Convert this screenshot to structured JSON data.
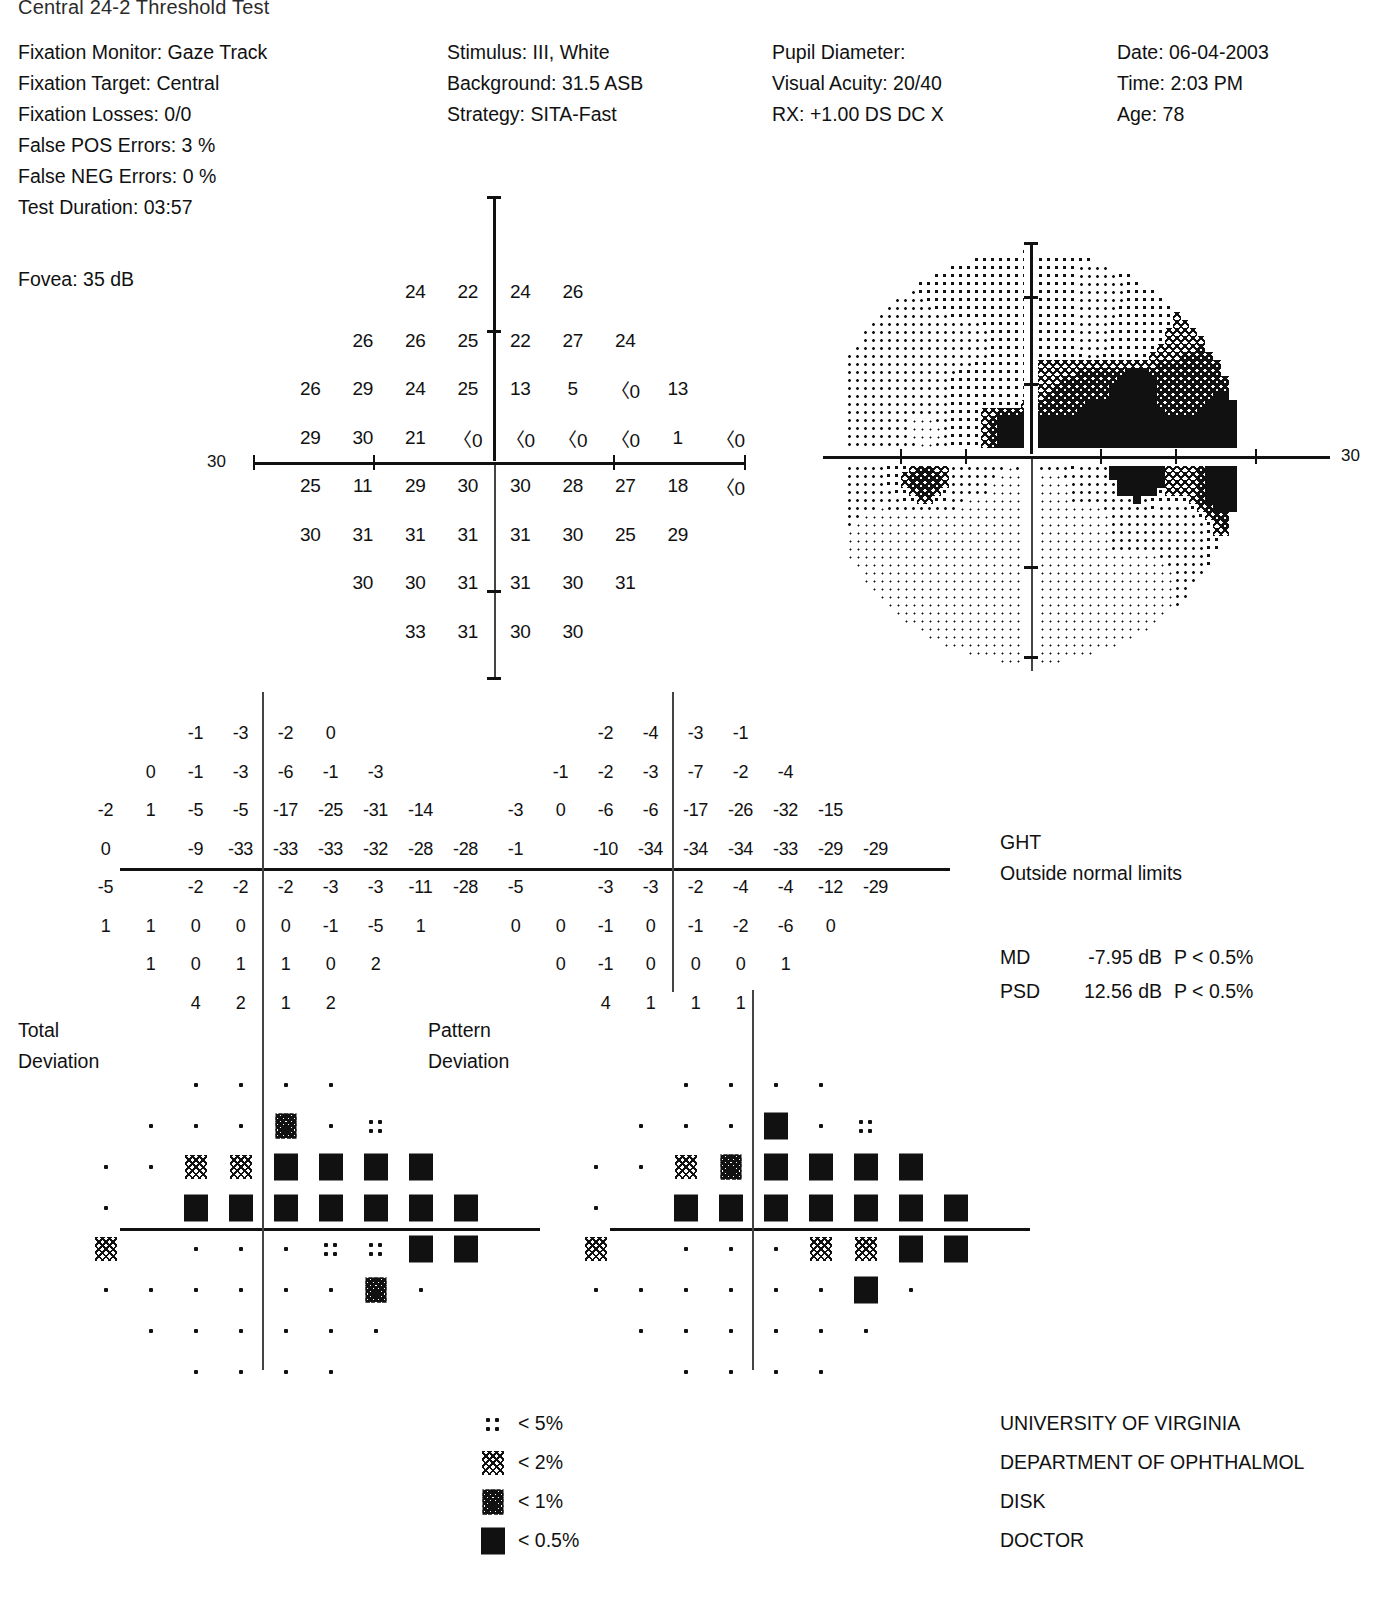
{
  "report": {
    "title": "Central 24-2 Threshold Test",
    "left_column": [
      "Fixation Monitor: Gaze Track",
      "Fixation Target: Central",
      "Fixation Losses: 0/0",
      "False POS Errors:  3 %",
      "False NEG Errors:  0 %",
      "Test Duration: 03:57"
    ],
    "fovea": "Fovea: 35 dB",
    "stimulus_column": [
      "Stimulus: III, White",
      "Background: 31.5 ASB",
      "Strategy: SITA-Fast"
    ],
    "patient_column": [
      "Pupil Diameter:",
      "Visual Acuity: 20/40",
      "RX: +1.00 DS     DC  X"
    ],
    "date_column": [
      "Date: 06-04-2003",
      "Time:  2:03 PM",
      "Age: 78"
    ]
  },
  "axis": {
    "sensitivity_label": "30",
    "grayscale_label": "30"
  },
  "sections": {
    "total_deviation": [
      "Total",
      "Deviation"
    ],
    "pattern_deviation": [
      "Pattern",
      "Deviation"
    ]
  },
  "ght": {
    "heading": "GHT",
    "result": "Outside normal limits"
  },
  "indices": [
    {
      "key": "MD",
      "value": "-7.95 dB",
      "p": "P < 0.5%"
    },
    {
      "key": "PSD",
      "value": "12.56 dB",
      "p": "P < 0.5%"
    }
  ],
  "legend": [
    {
      "symbol": "p5",
      "label": "< 5%"
    },
    {
      "symbol": "p2",
      "label": "< 2%"
    },
    {
      "symbol": "p1",
      "label": "< 1%"
    },
    {
      "symbol": "p05",
      "label": "< 0.5%"
    }
  ],
  "footer": [
    "UNIVERSITY OF VIRGINIA",
    "DEPARTMENT OF OPHTHALMOL",
    "DISK",
    "DOCTOR"
  ],
  "chart_data": [
    {
      "type": "table",
      "name": "sensitivity-values",
      "title": "Numeric sensitivity plot (dB)",
      "note": "24-2 grid, right eye layout. null = untested location. '<0' means below 0 dB.",
      "columns_x": [
        -27,
        -21,
        -15,
        -9,
        -3,
        3,
        9,
        15,
        21,
        27
      ],
      "rows_y": [
        21,
        15,
        9,
        3,
        -3,
        -9,
        -15,
        -21
      ],
      "rows": [
        [
          null,
          null,
          null,
          "24",
          "22",
          "24",
          "26",
          null,
          null,
          null
        ],
        [
          null,
          null,
          "26",
          "26",
          "25",
          "22",
          "27",
          "24",
          null,
          null
        ],
        [
          null,
          "26",
          "29",
          "24",
          "25",
          "13",
          "5",
          "<0",
          "13",
          null
        ],
        [
          null,
          "29",
          "30",
          "21",
          "<0",
          "<0",
          "<0",
          "<0",
          "1",
          "<0"
        ],
        [
          null,
          "25",
          "11",
          "29",
          "30",
          "30",
          "28",
          "27",
          "18",
          "<0"
        ],
        [
          null,
          "30",
          "31",
          "31",
          "31",
          "31",
          "30",
          "25",
          "29",
          null
        ],
        [
          null,
          null,
          "30",
          "30",
          "31",
          "31",
          "30",
          "31",
          null,
          null
        ],
        [
          null,
          null,
          null,
          "33",
          "31",
          "30",
          "30",
          null,
          null,
          null
        ]
      ]
    },
    {
      "type": "table",
      "name": "total-deviation-values",
      "title": "Total Deviation (dB)",
      "columns_x": [
        -27,
        -21,
        -15,
        -9,
        -3,
        3,
        9,
        15,
        21,
        27
      ],
      "rows_y": [
        21,
        15,
        9,
        3,
        -3,
        -9,
        -15,
        -21
      ],
      "rows": [
        [
          null,
          null,
          null,
          "-1",
          "-3",
          "-2",
          "0",
          null,
          null,
          null
        ],
        [
          null,
          null,
          "0",
          "-1",
          "-3",
          "-6",
          "-1",
          "-3",
          null,
          null
        ],
        [
          null,
          "-2",
          "1",
          "-5",
          "-5",
          "-17",
          "-25",
          "-31",
          "-14",
          null
        ],
        [
          null,
          "0",
          null,
          "-9",
          "-33",
          "-33",
          "-33",
          "-32",
          "-28",
          "-28"
        ],
        [
          null,
          "-5",
          null,
          "-2",
          "-2",
          "-2",
          "-3",
          "-3",
          "-11",
          "-28"
        ],
        [
          null,
          "1",
          "1",
          "0",
          "0",
          "0",
          "-1",
          "-5",
          "1",
          null
        ],
        [
          null,
          null,
          "1",
          "0",
          "1",
          "1",
          "0",
          "2",
          null,
          null
        ],
        [
          null,
          null,
          null,
          "4",
          "2",
          "1",
          "2",
          null,
          null,
          null
        ]
      ]
    },
    {
      "type": "table",
      "name": "pattern-deviation-values",
      "title": "Pattern Deviation (dB)",
      "columns_x": [
        -27,
        -21,
        -15,
        -9,
        -3,
        3,
        9,
        15,
        21,
        27
      ],
      "rows_y": [
        21,
        15,
        9,
        3,
        -3,
        -9,
        -15,
        -21
      ],
      "rows": [
        [
          null,
          null,
          null,
          "-2",
          "-4",
          "-3",
          "-1",
          null,
          null,
          null
        ],
        [
          null,
          null,
          "-1",
          "-2",
          "-3",
          "-7",
          "-2",
          "-4",
          null,
          null
        ],
        [
          null,
          "-3",
          "0",
          "-6",
          "-6",
          "-17",
          "-26",
          "-32",
          "-15",
          null
        ],
        [
          null,
          "-1",
          null,
          "-10",
          "-34",
          "-34",
          "-34",
          "-33",
          "-29",
          "-29"
        ],
        [
          null,
          "-5",
          null,
          "-3",
          "-3",
          "-2",
          "-4",
          "-4",
          "-12",
          "-29"
        ],
        [
          null,
          "0",
          "0",
          "-1",
          "0",
          "-1",
          "-2",
          "-6",
          "0",
          null
        ],
        [
          null,
          null,
          "0",
          "-1",
          "0",
          "0",
          "0",
          "1",
          null,
          null
        ],
        [
          null,
          null,
          null,
          "4",
          "1",
          "1",
          "1",
          null,
          null,
          null
        ]
      ]
    },
    {
      "type": "heatmap",
      "name": "total-deviation-probability",
      "title": "Total Deviation probability symbols",
      "note": "symbol codes: normal, p5 (<5%), p2 (<2%), p1 (<1%), p05 (<0.5%)",
      "columns_x": [
        -27,
        -21,
        -15,
        -9,
        -3,
        3,
        9,
        15,
        21,
        27
      ],
      "rows_y": [
        21,
        15,
        9,
        3,
        -3,
        -9,
        -15,
        -21
      ],
      "rows": [
        [
          null,
          null,
          null,
          "normal",
          "normal",
          "normal",
          "normal",
          null,
          null,
          null
        ],
        [
          null,
          null,
          "normal",
          "normal",
          "normal",
          "p1",
          "normal",
          "p5",
          null,
          null
        ],
        [
          null,
          "normal",
          "normal",
          "p2",
          "p2",
          "p05",
          "p05",
          "p05",
          "p05",
          null
        ],
        [
          null,
          "normal",
          null,
          "p05",
          "p05",
          "p05",
          "p05",
          "p05",
          "p05",
          "p05"
        ],
        [
          null,
          "p2",
          null,
          "normal",
          "normal",
          "normal",
          "p5",
          "p5",
          "p05",
          "p05"
        ],
        [
          null,
          "normal",
          "normal",
          "normal",
          "normal",
          "normal",
          "normal",
          "p1",
          "normal",
          null
        ],
        [
          null,
          null,
          "normal",
          "normal",
          "normal",
          "normal",
          "normal",
          "normal",
          null,
          null
        ],
        [
          null,
          null,
          null,
          "normal",
          "normal",
          "normal",
          "normal",
          null,
          null,
          null
        ]
      ]
    },
    {
      "type": "heatmap",
      "name": "pattern-deviation-probability",
      "title": "Pattern Deviation probability symbols",
      "note": "symbol codes: normal, p5 (<5%), p2 (<2%), p1 (<1%), p05 (<0.5%)",
      "columns_x": [
        -27,
        -21,
        -15,
        -9,
        -3,
        3,
        9,
        15,
        21,
        27
      ],
      "rows_y": [
        21,
        15,
        9,
        3,
        -3,
        -9,
        -15,
        -21
      ],
      "rows": [
        [
          null,
          null,
          null,
          "normal",
          "normal",
          "normal",
          "normal",
          null,
          null,
          null
        ],
        [
          null,
          null,
          "normal",
          "normal",
          "normal",
          "p05",
          "normal",
          "p5",
          null,
          null
        ],
        [
          null,
          "normal",
          "normal",
          "p2",
          "p1",
          "p05",
          "p05",
          "p05",
          "p05",
          null
        ],
        [
          null,
          "normal",
          null,
          "p05",
          "p05",
          "p05",
          "p05",
          "p05",
          "p05",
          "p05"
        ],
        [
          null,
          "p2",
          null,
          "normal",
          "normal",
          "normal",
          "p2",
          "p2",
          "p05",
          "p05"
        ],
        [
          null,
          "normal",
          "normal",
          "normal",
          "normal",
          "normal",
          "normal",
          "p05",
          "normal",
          null
        ],
        [
          null,
          null,
          "normal",
          "normal",
          "normal",
          "normal",
          "normal",
          "normal",
          null,
          null
        ],
        [
          null,
          null,
          null,
          "normal",
          "normal",
          "normal",
          "normal",
          null,
          null,
          null
        ]
      ]
    },
    {
      "type": "heatmap",
      "name": "grayscale-plot",
      "title": "Grayscale representation of sensitivity",
      "note": "Derived from sensitivity values; darker = lower sensitivity. Dense black defect occupies the superior field and the temporal periphery."
    }
  ]
}
